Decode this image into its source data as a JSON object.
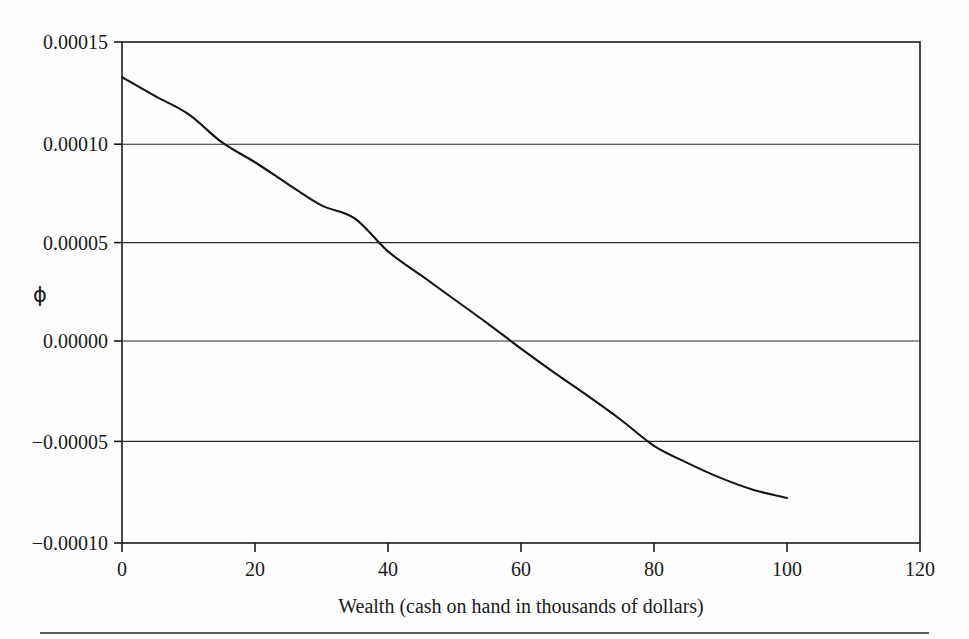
{
  "chart_data": {
    "type": "line",
    "title": "",
    "xlabel": "Wealth (cash on hand in thousands of dollars)",
    "ylabel": "ϕ",
    "xlim": [
      0,
      120
    ],
    "ylim": [
      -0.0001,
      0.00015
    ],
    "grid": true,
    "legend": null,
    "x_ticks": [
      0,
      20,
      40,
      60,
      80,
      100,
      120
    ],
    "x_tick_labels": [
      "0",
      "20",
      "40",
      "60",
      "80",
      "100",
      "120"
    ],
    "y_ticks": [
      0.00015,
      0.0001,
      5e-05,
      0.0,
      -5e-05,
      -0.0001
    ],
    "y_tick_labels": [
      "0.00015",
      "0.00010",
      "0.00005",
      "0.00000",
      "−0.00005",
      "−0.00010"
    ],
    "series": [
      {
        "name": "phi",
        "color": "#141414",
        "x": [
          0,
          5,
          10,
          15,
          20,
          25,
          30,
          35,
          40,
          45,
          50,
          55,
          60,
          65,
          70,
          75,
          80,
          85,
          90,
          95,
          100
        ],
        "y": [
          0.0001325,
          0.000123,
          0.000114,
          0.0001,
          9e-05,
          7.9e-05,
          6.85e-05,
          6.2e-05,
          4.55e-05,
          3.35e-05,
          2.15e-05,
          9.5e-06,
          -3e-06,
          -1.5e-05,
          -2.65e-05,
          -3.85e-05,
          -5.15e-05,
          -6e-05,
          -6.75e-05,
          -7.35e-05,
          -7.75e-05
        ]
      }
    ],
    "annotations": []
  },
  "figure": {
    "axis_titles": {
      "x": "Wealth (cash on hand in thousands of dollars)",
      "y": "ϕ"
    },
    "footer_rule": true
  }
}
